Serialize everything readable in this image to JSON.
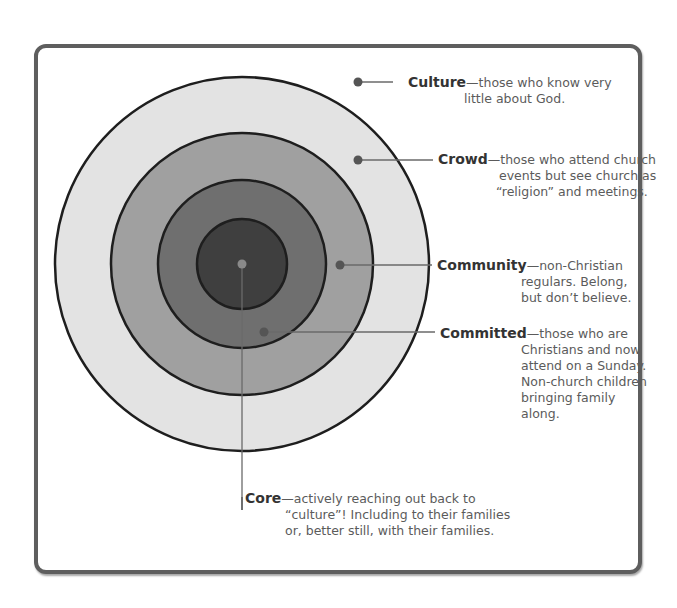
{
  "diagram": {
    "type": "concentric-circles",
    "center": [
      242,
      264
    ],
    "rings": [
      {
        "name": "Culture",
        "radius": 187,
        "fill": "#e3e3e3"
      },
      {
        "name": "Crowd",
        "radius": 131,
        "fill": "#a0a0a0"
      },
      {
        "name": "Community",
        "radius": 84,
        "fill": "#6f6f6f"
      },
      {
        "name": "Core",
        "radius": 45,
        "fill": "#3f3f3f"
      }
    ],
    "stroke_color": "#1e1e1e",
    "dot_color": "#555555",
    "line_color": "#6a6a6a"
  },
  "labels": {
    "culture": {
      "term": "Culture",
      "dash": "—",
      "line1": "those who know very",
      "lines": [
        "little about God."
      ]
    },
    "crowd": {
      "term": "Crowd",
      "dash": "—",
      "line1": "those who attend church",
      "lines": [
        "events but see church as",
        "“religion” and meetings."
      ]
    },
    "community": {
      "term": "Community",
      "dash": "—",
      "line1": "non-Christian",
      "lines": [
        "regulars. Belong,",
        "but don’t believe."
      ]
    },
    "committed": {
      "term": "Committed",
      "dash": "—",
      "line1": "those who are",
      "lines": [
        "Christians and now",
        "attend on a Sunday.",
        "Non-church children",
        "bringing family",
        "along."
      ]
    },
    "core": {
      "term": "Core",
      "dash": "—",
      "line1": "actively reaching out back to",
      "lines": [
        "“culture”! Including to their families",
        "or, better still, with their families."
      ]
    }
  }
}
